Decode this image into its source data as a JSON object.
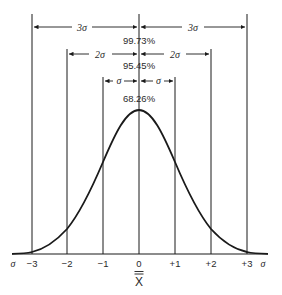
{
  "diagram": {
    "bands": [
      {
        "label_left": "3σ",
        "label_right": "3σ",
        "percent": "99.73%"
      },
      {
        "label_left": "2σ",
        "label_right": "2σ",
        "percent": "95.45%"
      },
      {
        "label_left": "σ",
        "label_right": "σ",
        "percent": "68.26%"
      }
    ],
    "axis": {
      "left_unit": "σ",
      "right_unit": "σ",
      "ticks": [
        "−3",
        "−2",
        "−1",
        "0",
        "+1",
        "+2",
        "+3"
      ],
      "label": "X̿"
    },
    "colors": {
      "line": "#1a1a1a",
      "background": "#ffffff"
    }
  }
}
